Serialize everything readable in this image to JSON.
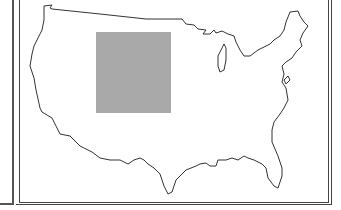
{
  "map": {
    "title": "",
    "region": "Contiguous United States",
    "outline_color": "#333333",
    "highlight": {
      "label": "Shaded rectangular region (west-central US)",
      "color": "#a9a9a9",
      "x": 96,
      "y": 32,
      "width": 75,
      "height": 81
    }
  }
}
